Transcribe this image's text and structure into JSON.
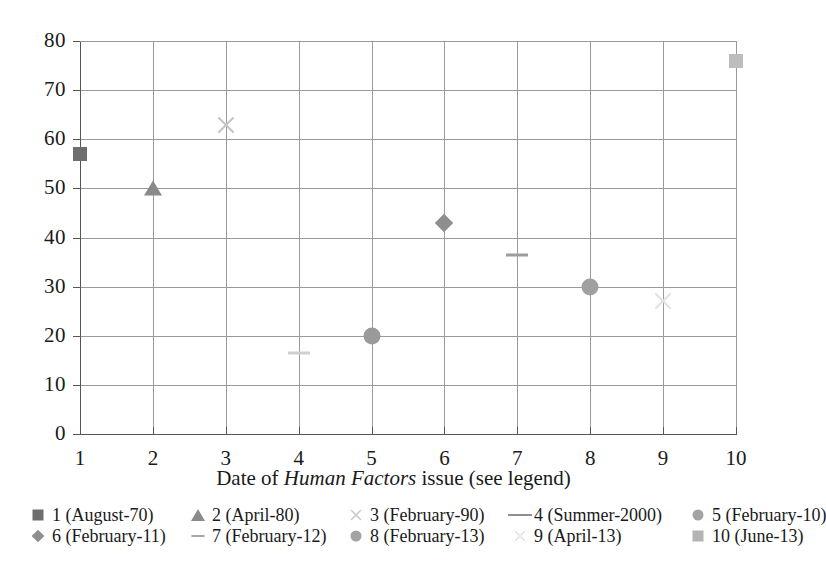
{
  "chart_data": {
    "type": "scatter",
    "title": "",
    "xlabel": "Date of Human Factors issue (see legend)",
    "xlabel_parts": [
      {
        "text": "Date of ",
        "italic": false
      },
      {
        "text": "Human Factors",
        "italic": true
      },
      {
        "text": " issue (see legend)",
        "italic": false
      }
    ],
    "ylabel": "",
    "xlim": [
      1,
      10
    ],
    "ylim": [
      0,
      80
    ],
    "xticks": [
      "1",
      "2",
      "3",
      "4",
      "5",
      "6",
      "7",
      "8",
      "9",
      "10"
    ],
    "yticks": [
      "0",
      "10",
      "20",
      "30",
      "40",
      "50",
      "60",
      "70",
      "80"
    ],
    "grid": true,
    "legend_position": "below-axis",
    "x": [
      1,
      2,
      3,
      4,
      5,
      6,
      7,
      8,
      9,
      10
    ],
    "values": [
      57,
      50,
      63,
      16.5,
      20,
      43,
      36.5,
      30,
      27,
      76
    ],
    "points": [
      {
        "index": 1,
        "x": 1,
        "y": 57,
        "marker": "square",
        "color": "#6e6e6e",
        "label": "1 (August-70)"
      },
      {
        "index": 2,
        "x": 2,
        "y": 50,
        "marker": "triangle",
        "color": "#8a8a8a",
        "label": "2 (April-80)"
      },
      {
        "index": 3,
        "x": 3,
        "y": 63,
        "marker": "cross",
        "color": "#c4c4c4",
        "label": "3 (February-90)"
      },
      {
        "index": 4,
        "x": 4,
        "y": 16.5,
        "marker": "dash",
        "color": "#cfcfcf",
        "label": "4 (Summer-2000)"
      },
      {
        "index": 5,
        "x": 5,
        "y": 20,
        "marker": "circle",
        "color": "#9a9a9a",
        "label": "5 (February-10)"
      },
      {
        "index": 6,
        "x": 6,
        "y": 43,
        "marker": "diamond",
        "color": "#8e8e8e",
        "label": "6 (February-11)"
      },
      {
        "index": 7,
        "x": 7,
        "y": 36.5,
        "marker": "dash",
        "color": "#9c9c9c",
        "label": "7 (February-12)"
      },
      {
        "index": 8,
        "x": 8,
        "y": 30,
        "marker": "circle",
        "color": "#a0a0a0",
        "label": "8 (February-13)"
      },
      {
        "index": 9,
        "x": 9,
        "y": 27,
        "marker": "cross",
        "color": "#e2e2e2",
        "label": "9 (April-13)"
      },
      {
        "index": 10,
        "x": 10,
        "y": 76,
        "marker": "square",
        "color": "#bdbdbd",
        "label": "10 (June-13)"
      }
    ],
    "legend": [
      {
        "label": "1 (August-70)",
        "marker": "square",
        "color": "#6e6e6e"
      },
      {
        "label": "2 (April-80)",
        "marker": "triangle",
        "color": "#8a8a8a"
      },
      {
        "label": "3 (February-90)",
        "marker": "cross",
        "color": "#c9c9c9"
      },
      {
        "label": "4 (Summer-2000)",
        "marker": "dash",
        "color": "#8f8f8f"
      },
      {
        "label": "5 (February-10)",
        "marker": "circle",
        "color": "#a3a3a3"
      },
      {
        "label": "6 (February-11)",
        "marker": "diamond",
        "color": "#8e8e8e"
      },
      {
        "label": "7 (February-12)",
        "marker": "dash-thin",
        "color": "#a8a8a8"
      },
      {
        "label": "8 (February-13)",
        "marker": "circle",
        "color": "#a3a3a3"
      },
      {
        "label": "9 (April-13)",
        "marker": "cross",
        "color": "#e4e4e4"
      },
      {
        "label": "10 (June-13)",
        "marker": "square",
        "color": "#b4b4b4"
      }
    ],
    "colors": {
      "axis": "#555555",
      "grid": "#9a9a9a",
      "text": "#1a1a1a",
      "background": "#ffffff"
    }
  }
}
